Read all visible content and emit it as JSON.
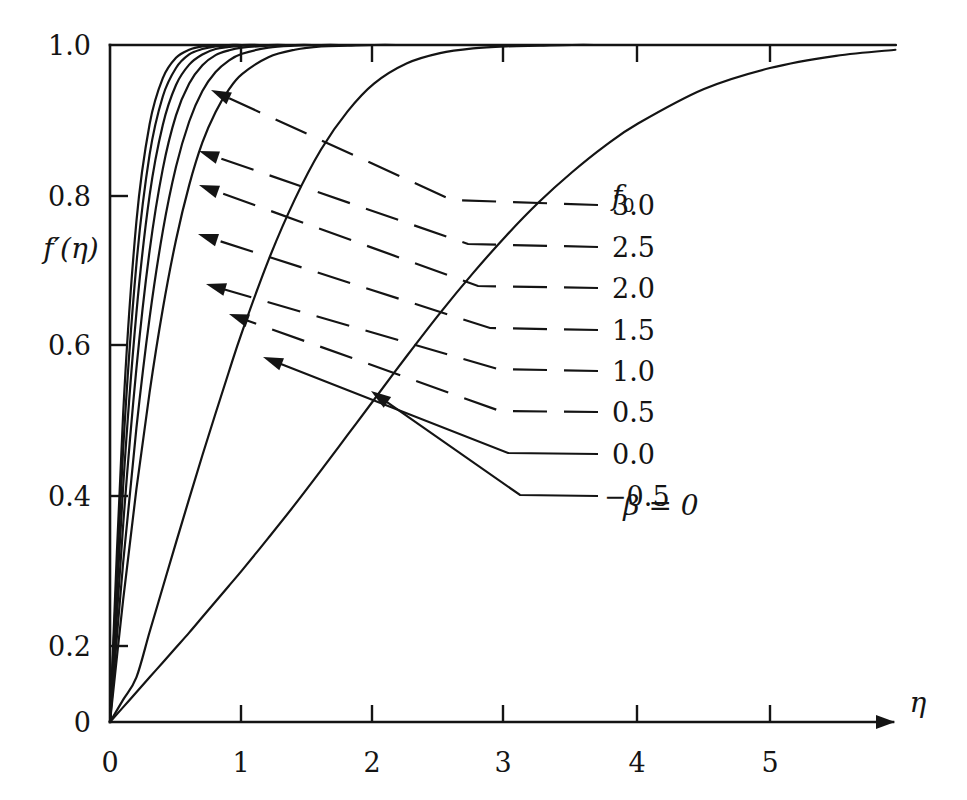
{
  "figure": {
    "caption_annotation": "β = 0",
    "annotation_beta_symbol": "β",
    "annotation_equals_zero": "= 0"
  },
  "axes": {
    "x": {
      "title": "η",
      "ticks": [
        "0",
        "1",
        "2",
        "3",
        "4",
        "5"
      ],
      "tick_values": [
        0,
        1,
        2,
        3,
        4,
        5
      ],
      "range": [
        0,
        5.95
      ]
    },
    "y": {
      "title_base": "f",
      "title_prime": "′",
      "title_arg": "(η)",
      "title": "f′(η)",
      "ticks": [
        "0",
        "0.2",
        "0.4",
        "0.6",
        "0.8",
        "1.0"
      ],
      "tick_values": [
        0,
        0.2,
        0.4,
        0.6,
        0.8,
        1.0
      ],
      "range": [
        0,
        1.01
      ]
    }
  },
  "legend": {
    "header": "f",
    "header_sub": "0",
    "header_full": "f₀",
    "labels": [
      "3.0",
      "2.5",
      "2.0",
      "1.5",
      "1.0",
      "0.5",
      "0.0",
      "−0.5"
    ]
  },
  "chart_data": {
    "type": "line",
    "title": "",
    "subtitle": "",
    "xlabel": "η",
    "ylabel": "f′(η)",
    "xlim": [
      0,
      5.95
    ],
    "ylim": [
      0,
      1.01
    ],
    "grid": false,
    "legend_position": "right-inside",
    "annotations": [
      "β = 0"
    ],
    "x": [
      0,
      0.1,
      0.2,
      0.3,
      0.4,
      0.5,
      0.6,
      0.7,
      0.8,
      0.9,
      1.0,
      1.2,
      1.4,
      1.6,
      1.8,
      2.0,
      2.25,
      2.5,
      2.75,
      3.0,
      3.25,
      3.5,
      3.75,
      4.0,
      4.5,
      5.0,
      5.5,
      5.95
    ],
    "series": [
      {
        "name": "3.0",
        "f0": 3.0,
        "values": [
          0,
          0.457,
          0.739,
          0.883,
          0.951,
          0.981,
          0.993,
          0.998,
          0.999,
          1.0,
          1.0,
          1.0,
          1.0,
          1.0,
          1.0,
          1.0,
          1.0,
          1.0,
          1.0,
          1.0,
          1.0,
          1.0,
          1.0,
          1.0,
          1.0,
          1.0,
          1.0,
          1.0
        ]
      },
      {
        "name": "2.5",
        "f0": 2.5,
        "values": [
          0,
          0.404,
          0.676,
          0.838,
          0.924,
          0.966,
          0.986,
          0.994,
          0.998,
          0.999,
          1.0,
          1.0,
          1.0,
          1.0,
          1.0,
          1.0,
          1.0,
          1.0,
          1.0,
          1.0,
          1.0,
          1.0,
          1.0,
          1.0,
          1.0,
          1.0,
          1.0,
          1.0
        ]
      },
      {
        "name": "2.0",
        "f0": 2.0,
        "values": [
          0,
          0.349,
          0.604,
          0.778,
          0.882,
          0.941,
          0.971,
          0.986,
          0.994,
          0.997,
          0.999,
          1.0,
          1.0,
          1.0,
          1.0,
          1.0,
          1.0,
          1.0,
          1.0,
          1.0,
          1.0,
          1.0,
          1.0,
          1.0,
          1.0,
          1.0,
          1.0,
          1.0
        ]
      },
      {
        "name": "1.5",
        "f0": 1.5,
        "values": [
          0,
          0.292,
          0.522,
          0.696,
          0.817,
          0.896,
          0.943,
          0.97,
          0.985,
          0.992,
          0.996,
          0.999,
          1.0,
          1.0,
          1.0,
          1.0,
          1.0,
          1.0,
          1.0,
          1.0,
          1.0,
          1.0,
          1.0,
          1.0,
          1.0,
          1.0,
          1.0,
          1.0
        ]
      },
      {
        "name": "1.0",
        "f0": 1.0,
        "values": [
          0,
          0.236,
          0.434,
          0.597,
          0.725,
          0.82,
          0.887,
          0.932,
          0.96,
          0.977,
          0.987,
          0.996,
          0.999,
          1.0,
          1.0,
          1.0,
          1.0,
          1.0,
          1.0,
          1.0,
          1.0,
          1.0,
          1.0,
          1.0,
          1.0,
          1.0,
          1.0,
          1.0
        ]
      },
      {
        "name": "0.5",
        "f0": 0.5,
        "values": [
          0,
          0.181,
          0.344,
          0.487,
          0.61,
          0.712,
          0.793,
          0.856,
          0.901,
          0.934,
          0.957,
          0.982,
          0.993,
          0.998,
          0.999,
          1.0,
          1.0,
          1.0,
          1.0,
          1.0,
          1.0,
          1.0,
          1.0,
          1.0,
          1.0,
          1.0,
          1.0,
          1.0
        ]
      },
      {
        "name": "0.0",
        "f0": 0.0,
        "values": [
          0,
          0.033,
          0.066,
          0.133,
          0.199,
          0.265,
          0.33,
          0.394,
          0.456,
          0.517,
          0.576,
          0.682,
          0.772,
          0.846,
          0.902,
          0.943,
          0.973,
          0.988,
          0.995,
          0.998,
          0.999,
          1.0,
          1.0,
          1.0,
          1.0,
          1.0,
          1.0,
          1.0
        ]
      },
      {
        "name": "−0.5",
        "f0": -0.5,
        "values": [
          0,
          0.022,
          0.044,
          0.066,
          0.088,
          0.11,
          0.132,
          0.155,
          0.178,
          0.201,
          0.224,
          0.272,
          0.321,
          0.372,
          0.424,
          0.476,
          0.541,
          0.604,
          0.663,
          0.718,
          0.768,
          0.812,
          0.851,
          0.884,
          0.935,
          0.966,
          0.984,
          0.993
        ]
      }
    ]
  },
  "leaders": [
    {
      "label": "3.0",
      "arrow_x": 211,
      "arrow_y": 90,
      "bend_x": 452,
      "bend_y": 200,
      "end_x": 598,
      "end_y": 205,
      "dashed": true
    },
    {
      "label": "2.5",
      "arrow_x": 199,
      "arrow_y": 151,
      "bend_x": 468,
      "bend_y": 244,
      "end_x": 598,
      "end_y": 247,
      "dashed": true
    },
    {
      "label": "2.0",
      "arrow_x": 199,
      "arrow_y": 185,
      "bend_x": 478,
      "bend_y": 286,
      "end_x": 598,
      "end_y": 288,
      "dashed": true
    },
    {
      "label": "1.5",
      "arrow_x": 198,
      "arrow_y": 234,
      "bend_x": 490,
      "bend_y": 328,
      "end_x": 598,
      "end_y": 330,
      "dashed": true
    },
    {
      "label": "1.0",
      "arrow_x": 206,
      "arrow_y": 284,
      "bend_x": 498,
      "bend_y": 369,
      "end_x": 598,
      "end_y": 371,
      "dashed": true
    },
    {
      "label": "0.5",
      "arrow_x": 229,
      "arrow_y": 314,
      "bend_x": 500,
      "bend_y": 411,
      "end_x": 598,
      "end_y": 412,
      "dashed": true
    },
    {
      "label": "0.0",
      "arrow_x": 263,
      "arrow_y": 357,
      "bend_x": 508,
      "bend_y": 453,
      "end_x": 598,
      "end_y": 454,
      "dashed": false
    },
    {
      "label": "−0.5",
      "arrow_x": 371,
      "arrow_y": 391,
      "bend_x": 520,
      "bend_y": 495,
      "end_x": 598,
      "end_y": 496,
      "dashed": false
    }
  ]
}
